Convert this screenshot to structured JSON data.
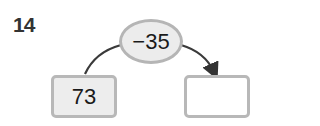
{
  "problem": {
    "number": "14"
  },
  "operation": {
    "label": "−35",
    "operator": "minus",
    "operand": 35
  },
  "start_value": "73",
  "result_value": "",
  "colors": {
    "border": "#b5b5b5",
    "fill": "#ececec",
    "arrow": "#333333",
    "text": "#1a1a1a"
  }
}
